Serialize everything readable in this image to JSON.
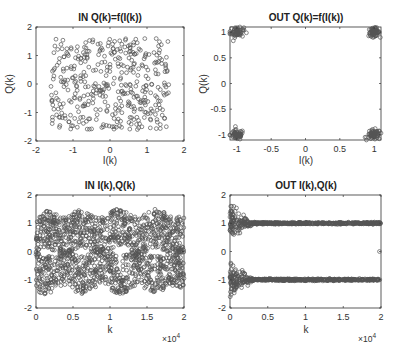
{
  "chart_data": [
    {
      "id": "in-constellation",
      "type": "scatter",
      "title": "IN Q(k)=f(I(k))",
      "xlabel": "I(k)",
      "ylabel": "Q(k)",
      "xlim": [
        -2,
        2
      ],
      "ylim": [
        -2,
        2
      ],
      "xticks": [
        -2,
        -1,
        0,
        1,
        2
      ],
      "yticks": [
        -2,
        -1,
        0,
        1,
        2
      ],
      "xtick_labels": [
        "-2",
        "-1",
        "0",
        "1",
        "2"
      ],
      "ytick_labels": [
        "-2",
        "-1",
        "0",
        "1",
        "2"
      ],
      "marker": "circle-open",
      "grid": false,
      "description": "Rotated/dispersed QPSK input samples, roughly uniform over I,Q in [-1.6, 1.6]",
      "distribution": {
        "kind": "uniform",
        "x_range": [
          -1.6,
          1.6
        ],
        "y_range": [
          -1.6,
          1.6
        ],
        "n_points": 420
      }
    },
    {
      "id": "out-constellation",
      "type": "scatter",
      "title": "OUT Q(k)=f(I(k))",
      "xlabel": "I(k)",
      "ylabel": "Q(k)",
      "xlim": [
        -1.1,
        1.1
      ],
      "ylim": [
        -1.1,
        1.1
      ],
      "xticks": [
        -1,
        -0.5,
        0,
        0.5,
        1
      ],
      "yticks": [
        -1,
        -0.5,
        0,
        0.5,
        1
      ],
      "xtick_labels": [
        "-1",
        "-0.5",
        "0",
        "0.5",
        "1"
      ],
      "ytick_labels": [
        "-1",
        "-0.5",
        "0",
        "0.5",
        "1"
      ],
      "marker": "circle-open",
      "grid": false,
      "description": "Equalized output: four tight clusters at (±1, ±1)",
      "clusters": [
        {
          "center": [
            -1,
            1
          ],
          "spread": 0.05,
          "n_points": 60
        },
        {
          "center": [
            1,
            1
          ],
          "spread": 0.04,
          "n_points": 70
        },
        {
          "center": [
            -1,
            -1
          ],
          "spread": 0.05,
          "n_points": 60
        },
        {
          "center": [
            1,
            -1
          ],
          "spread": 0.05,
          "n_points": 60
        }
      ]
    },
    {
      "id": "in-timeseries",
      "type": "scatter",
      "title": "IN I(k),Q(k)",
      "xlabel": "k",
      "ylabel": "",
      "x_exponent": "×10^4",
      "xlim": [
        0,
        2
      ],
      "ylim": [
        -2,
        2
      ],
      "xticks": [
        0,
        0.5,
        1,
        1.5,
        2
      ],
      "yticks": [
        -2,
        -1,
        0,
        1,
        2
      ],
      "xtick_labels": [
        "0",
        "0.5",
        "1",
        "1.5",
        "2"
      ],
      "ytick_labels": [
        "-2",
        "-1",
        "0",
        "1",
        "2"
      ],
      "marker": "circle-open",
      "grid": false,
      "description": "Input I and Q samples over k = 0..20000, oscillating within [-1.6, 1.6] with periodic structure",
      "distribution": {
        "kind": "periodic-band",
        "x_range": [
          0,
          2
        ],
        "y_range": [
          -1.6,
          1.6
        ],
        "period": 0.5,
        "n_points": 1500
      }
    },
    {
      "id": "out-timeseries",
      "type": "scatter",
      "title": "OUT I(k),Q(k)",
      "xlabel": "k",
      "ylabel": "",
      "x_exponent": "×10^4",
      "xlim": [
        0,
        2
      ],
      "ylim": [
        -2,
        2
      ],
      "xticks": [
        0,
        0.5,
        1,
        1.5,
        2
      ],
      "yticks": [
        -2,
        -1,
        0,
        1,
        2
      ],
      "xtick_labels": [
        "0",
        "0.5",
        "1",
        "1.5",
        "2"
      ],
      "ytick_labels": [
        "-2",
        "-1",
        "0",
        "1",
        "2"
      ],
      "marker": "circle-open",
      "grid": false,
      "description": "Equalizer output converging: initial spread for k < 0.3e4, then tight bands at +1 and -1",
      "levels": [
        1,
        -1
      ],
      "convergence_k": 0.3,
      "initial_spread": 0.6,
      "final_spread": 0.03,
      "outliers": [
        [
          1.98,
          0
        ]
      ],
      "n_points": 1200
    }
  ]
}
